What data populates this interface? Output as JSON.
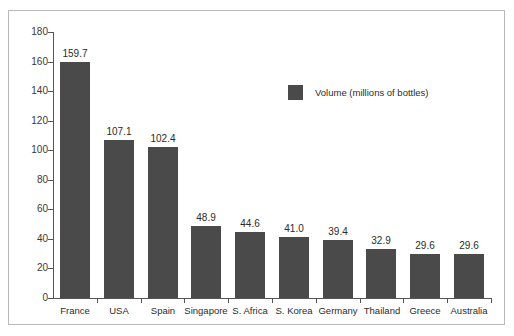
{
  "chart_data": {
    "type": "bar",
    "title": "",
    "subtitle": "",
    "xlabel": "",
    "ylabel": "",
    "ylim": [
      0,
      180
    ],
    "ytick_step": 20,
    "yticks": [
      "180",
      "160",
      "140",
      "120",
      "100",
      "80",
      "60",
      "40",
      "20",
      "0"
    ],
    "grid": false,
    "legend_position": "upper-center",
    "legend": [
      "Volume (millions of bottles)"
    ],
    "categories": [
      "France",
      "USA",
      "Spain",
      "Singapore",
      "S. Africa",
      "S. Korea",
      "Germany",
      "Thailand",
      "Greece",
      "Australia"
    ],
    "values": [
      159.7,
      107.1,
      102.4,
      48.9,
      44.6,
      41.0,
      39.4,
      32.9,
      29.6,
      29.6
    ],
    "value_labels": [
      "159.7",
      "107.1",
      "102.4",
      "48.9",
      "44.6",
      "41.0",
      "39.4",
      "32.9",
      "29.6",
      "29.6"
    ],
    "series": [
      {
        "name": "Volume (millions of bottles)",
        "values": [
          159.7,
          107.1,
          102.4,
          48.9,
          44.6,
          41.0,
          39.4,
          32.9,
          29.6,
          29.6
        ]
      }
    ]
  },
  "colors": {
    "bar": "#4a4a4a",
    "axis": "#555555",
    "frame": "#b9b9b9",
    "background": "#ffffff",
    "text": "#2b2b2b"
  },
  "legend": {
    "swatch_name": "legend-color-swatch",
    "label": "Volume (millions of bottles)"
  }
}
